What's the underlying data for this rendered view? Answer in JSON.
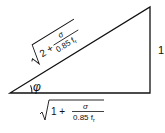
{
  "diagram": {
    "type": "right-triangle",
    "stroke_color": "#111111",
    "background": "#ffffff",
    "angle_label": "φ",
    "vertical_side_label": "1",
    "hypotenuse_label": {
      "root_prefix": "2 +",
      "numerator": "σ",
      "denominator": "0.85 f",
      "denominator_subscript": "r",
      "full_text": "√(2 + σ / 0.85 f_r)"
    },
    "base_label": {
      "root_prefix": "1 +",
      "numerator": "σ",
      "denominator": "0.85 f",
      "denominator_subscript": "r",
      "full_text": "√(1 + σ / 0.85 f_r)"
    }
  }
}
